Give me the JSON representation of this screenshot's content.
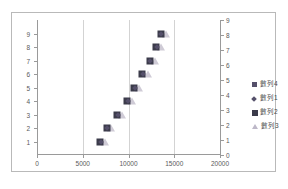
{
  "chart_data": {
    "type": "bar",
    "title": "",
    "xlabel": "",
    "ylabel": "",
    "grid": true,
    "legend_position": "right",
    "categories": [
      "1",
      "2",
      "3",
      "4",
      "5",
      "6",
      "7",
      "8",
      "9"
    ],
    "xlim": [
      0,
      20000
    ],
    "xticks": [
      "0",
      "5000",
      "10000",
      "15000",
      "20000"
    ],
    "xtick_values": [
      0,
      5000,
      10000,
      15000,
      20000
    ],
    "yticks": [
      "1",
      "2",
      "3",
      "4",
      "5",
      "6",
      "7",
      "8",
      "9"
    ],
    "ylim": [
      0,
      9
    ],
    "secondary_axis": {
      "ticks": [
        "0",
        "1",
        "2",
        "3",
        "4",
        "5",
        "6",
        "7",
        "8",
        "9"
      ],
      "tick_values": [
        0,
        1,
        2,
        3,
        4,
        5,
        6,
        7,
        8,
        9
      ],
      "lim": [
        0,
        9
      ]
    },
    "series": [
      {
        "name": "數列4",
        "marker": "square",
        "color": "#8a8096",
        "type": "bar",
        "values": [
          15000,
          15000,
          15000,
          15000,
          15000,
          15000,
          15000,
          15000,
          15000
        ]
      },
      {
        "name": "數列1",
        "marker": "diamond",
        "color": "#55506a",
        "type": "scatter",
        "values": [
          7000,
          7700,
          8800,
          9900,
          10700,
          11600,
          12400,
          13100,
          13600
        ]
      },
      {
        "name": "數列2",
        "marker": "filled-square",
        "color": "#3b3b4a",
        "type": "scatter",
        "values": [
          6900,
          7600,
          8700,
          9800,
          10600,
          11500,
          12300,
          13000,
          13500
        ]
      },
      {
        "name": "數列3",
        "marker": "triangle",
        "color": "#cfcbd6",
        "type": "scatter",
        "values": [
          7400,
          8100,
          9300,
          10400,
          11200,
          12100,
          12900,
          13600,
          14100
        ]
      }
    ]
  },
  "legend": {
    "items": [
      {
        "label": "數列4",
        "marker": "square"
      },
      {
        "label": "數列1",
        "marker": "diamond"
      },
      {
        "label": "數列2",
        "marker": "filled-square"
      },
      {
        "label": "數列3",
        "marker": "triangle"
      }
    ]
  }
}
